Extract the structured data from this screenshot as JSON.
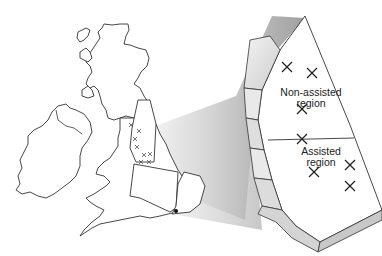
{
  "figure": {
    "labels": {
      "non_assisted": [
        "Non-assisted",
        "region"
      ],
      "assisted": [
        "Assisted",
        "region"
      ]
    },
    "markers": {
      "non_assisted_crosses": 3,
      "assisted_crosses": 4,
      "map_small_crosses": 8,
      "map_dot": 1
    },
    "caption_fragment": "",
    "colors": {
      "outline": "#333333",
      "shadow_dark": "#8a8a8a",
      "shadow_light": "#e6e6e6",
      "background": "#ffffff"
    }
  }
}
